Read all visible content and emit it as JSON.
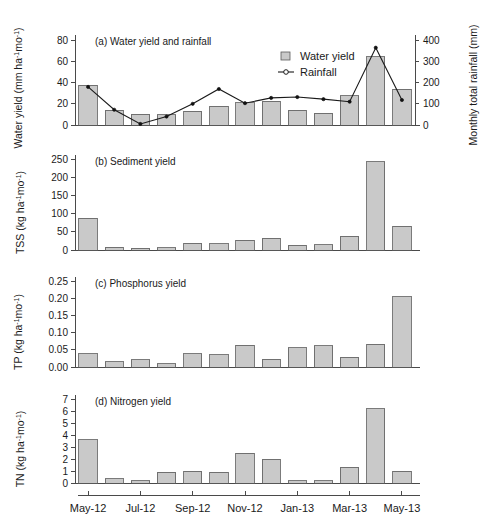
{
  "figure": {
    "background": "#ffffff",
    "bar_fill": "#c9c9c9",
    "bar_stroke": "#5a5a5a",
    "line_color": "#1a1a1a"
  },
  "categories": [
    "May-12",
    "Jun-12",
    "Jul-12",
    "Aug-12",
    "Sep-12",
    "Oct-12",
    "Nov-12",
    "Dec-12",
    "Jan-13",
    "Feb-13",
    "Mar-13",
    "Apr-13",
    "May-13"
  ],
  "xaxis": {
    "tick_labels": [
      "May-12",
      "Jul-12",
      "Sep-12",
      "Nov-12",
      "Jan-13",
      "Mar-13",
      "May-13"
    ],
    "tick_indices": [
      0,
      2,
      4,
      6,
      8,
      10,
      12
    ]
  },
  "legend": {
    "items": [
      {
        "label": "Water yield",
        "marker": "bar-swatch"
      },
      {
        "label": "Rainfall",
        "marker": "line-circle"
      }
    ]
  },
  "panels": [
    {
      "id": "a",
      "title": "(a) Water yield and rainfall",
      "ylabel_parts": {
        "main": "Water yield (mm ha",
        "sup1": "-1",
        "mid": "mo",
        "sup2": "-1",
        "close": ")"
      },
      "ylabel_text": "Water yield (mm ha-1 mo-1)",
      "y2label_text": "Monthly total rainfall (mm)",
      "yticks": [
        0,
        20,
        40,
        60,
        80
      ],
      "ylim": [
        0,
        85
      ],
      "y2ticks": [
        0,
        100,
        200,
        300,
        400
      ],
      "y2lim": [
        0,
        425
      ]
    },
    {
      "id": "b",
      "title": "(b) Sediment yield",
      "ylabel_parts": {
        "main": "TSS (kg ha",
        "sup1": "-1",
        "mid": "mo",
        "sup2": "-1",
        "close": ")"
      },
      "ylabel_text": "TSS (kg ha-1 mo-1)",
      "yticks": [
        0,
        50,
        100,
        150,
        200,
        250
      ],
      "ylim": [
        0,
        262
      ]
    },
    {
      "id": "c",
      "title": "(c) Phosphorus yield",
      "ylabel_parts": {
        "main": "TP (kg ha",
        "sup1": "-1",
        "mid": "mo",
        "sup2": "-1",
        "close": ")"
      },
      "ylabel_text": "TP (kg ha-1 mo-1)",
      "yticks": [
        "0.00",
        "0.05",
        "0.10",
        "0.15",
        "0.20",
        "0.25"
      ],
      "ytick_values": [
        0,
        0.05,
        0.1,
        0.15,
        0.2,
        0.25
      ],
      "ylim": [
        0,
        0.262
      ]
    },
    {
      "id": "d",
      "title": "(d) Nitrogen yield",
      "ylabel_parts": {
        "main": "TN (kg ha",
        "sup1": "-1",
        "mid": "mo",
        "sup2": "-1",
        "close": ")"
      },
      "ylabel_text": "TN (kg ha-1 mo-1)",
      "yticks": [
        0,
        1,
        2,
        3,
        4,
        5,
        6,
        7
      ],
      "ylim": [
        0,
        7.35
      ]
    }
  ],
  "chart_data": [
    {
      "type": "bar",
      "panel": "a",
      "title": "(a) Water yield and rainfall",
      "xlabel": "",
      "ylabel": "Water yield (mm ha-1 mo-1)",
      "y2label": "Monthly total rainfall (mm)",
      "categories": [
        "May-12",
        "Jun-12",
        "Jul-12",
        "Aug-12",
        "Sep-12",
        "Oct-12",
        "Nov-12",
        "Dec-12",
        "Jan-13",
        "Feb-13",
        "Mar-13",
        "Apr-13",
        "May-13"
      ],
      "ylim": [
        0,
        85
      ],
      "y2lim": [
        0,
        425
      ],
      "grid": false,
      "legend_position": "upper-center-right",
      "series": [
        {
          "name": "Water yield",
          "type": "bar",
          "axis": "left",
          "values": [
            37.5,
            14.0,
            10.0,
            9.5,
            13.0,
            17.5,
            21.0,
            22.5,
            14.0,
            11.0,
            27.5,
            64.5,
            34.0
          ]
        },
        {
          "name": "Rainfall",
          "type": "line",
          "axis": "right",
          "values": [
            180,
            72,
            5,
            40,
            100,
            170,
            103,
            128,
            132,
            122,
            110,
            365,
            118
          ]
        }
      ]
    },
    {
      "type": "bar",
      "panel": "b",
      "title": "(b) Sediment yield",
      "xlabel": "",
      "ylabel": "TSS (kg ha-1 mo-1)",
      "categories": [
        "May-12",
        "Jun-12",
        "Jul-12",
        "Aug-12",
        "Sep-12",
        "Oct-12",
        "Nov-12",
        "Dec-12",
        "Jan-13",
        "Feb-13",
        "Mar-13",
        "Apr-13",
        "May-13"
      ],
      "ylim": [
        0,
        262
      ],
      "grid": false,
      "values": [
        88,
        8,
        5,
        6,
        18,
        17,
        27,
        33,
        13,
        15,
        38,
        243,
        65
      ]
    },
    {
      "type": "bar",
      "panel": "c",
      "title": "(c) Phosphorus yield",
      "xlabel": "",
      "ylabel": "TP (kg ha-1 mo-1)",
      "categories": [
        "May-12",
        "Jun-12",
        "Jul-12",
        "Aug-12",
        "Sep-12",
        "Oct-12",
        "Nov-12",
        "Dec-12",
        "Jan-13",
        "Feb-13",
        "Mar-13",
        "Apr-13",
        "May-13"
      ],
      "ylim": [
        0,
        0.262
      ],
      "grid": false,
      "values": [
        0.038,
        0.015,
        0.021,
        0.009,
        0.039,
        0.035,
        0.063,
        0.023,
        0.056,
        0.062,
        0.029,
        0.066,
        0.205
      ]
    },
    {
      "type": "bar",
      "panel": "d",
      "title": "(d) Nitrogen yield",
      "xlabel": "",
      "ylabel": "TN (kg ha-1 mo-1)",
      "categories": [
        "May-12",
        "Jun-12",
        "Jul-12",
        "Aug-12",
        "Sep-12",
        "Oct-12",
        "Nov-12",
        "Dec-12",
        "Jan-13",
        "Feb-13",
        "Mar-13",
        "Apr-13",
        "May-13"
      ],
      "ylim": [
        0,
        7.35
      ],
      "grid": false,
      "values": [
        3.6,
        0.35,
        0.2,
        0.9,
        1.0,
        0.9,
        2.5,
        2.0,
        0.2,
        0.2,
        1.3,
        6.2,
        1.0
      ]
    }
  ]
}
